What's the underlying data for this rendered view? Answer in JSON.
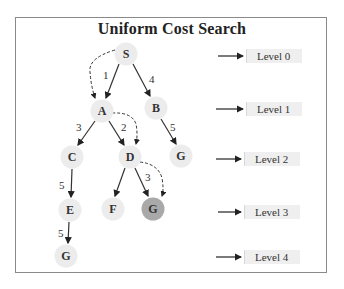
{
  "title": "Uniform Cost Search",
  "colors": {
    "node_fill": "#ececec",
    "goal_fill": "#a9a9a9",
    "edge": "#333333",
    "frame": "#8a8a8a",
    "level_box": "#efefef"
  },
  "nodes": [
    {
      "id": "S",
      "label": "S",
      "x": 126,
      "y": 54,
      "level": 0
    },
    {
      "id": "A",
      "label": "A",
      "x": 102,
      "y": 111,
      "level": 1
    },
    {
      "id": "B",
      "label": "B",
      "x": 156,
      "y": 108,
      "level": 1
    },
    {
      "id": "C",
      "label": "C",
      "x": 72,
      "y": 157,
      "level": 2
    },
    {
      "id": "D",
      "label": "D",
      "x": 130,
      "y": 157,
      "level": 2
    },
    {
      "id": "G1",
      "label": "G",
      "x": 181,
      "y": 156,
      "level": 2
    },
    {
      "id": "E",
      "label": "E",
      "x": 70,
      "y": 210,
      "level": 3
    },
    {
      "id": "F",
      "label": "F",
      "x": 113,
      "y": 209,
      "level": 3
    },
    {
      "id": "G2",
      "label": "G",
      "x": 153,
      "y": 209,
      "level": 3,
      "highlighted": true
    },
    {
      "id": "G3",
      "label": "G",
      "x": 66,
      "y": 256,
      "level": 4
    }
  ],
  "edges": [
    {
      "from": "S",
      "to": "A",
      "cost": "1"
    },
    {
      "from": "S",
      "to": "B",
      "cost": "4"
    },
    {
      "from": "A",
      "to": "C",
      "cost": "3"
    },
    {
      "from": "A",
      "to": "D",
      "cost": "2"
    },
    {
      "from": "B",
      "to": "G1",
      "cost": "5"
    },
    {
      "from": "C",
      "to": "E",
      "cost": "5"
    },
    {
      "from": "D",
      "to": "F",
      "cost": ""
    },
    {
      "from": "D",
      "to": "G2",
      "cost": "3"
    },
    {
      "from": "E",
      "to": "G3",
      "cost": "5"
    }
  ],
  "search_path": [
    "S",
    "A",
    "D",
    "G2"
  ],
  "levels": [
    {
      "label": "Level 0",
      "y": 56
    },
    {
      "label": "Level 1",
      "y": 110
    },
    {
      "label": "Level 2",
      "y": 160
    },
    {
      "label": "Level 3",
      "y": 213
    },
    {
      "label": "Level 4",
      "y": 258
    }
  ]
}
